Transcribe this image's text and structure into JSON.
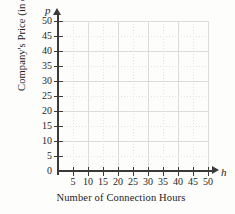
{
  "chart_data": {
    "type": "scatter",
    "title": "",
    "subtitle": "",
    "xlabel": "Number of Connection Hours",
    "ylabel": "Company's Price (in dollars)",
    "x_var": "h",
    "y_var": "p",
    "xlim": [
      0,
      50
    ],
    "ylim": [
      0,
      50
    ],
    "x_ticks": [
      5,
      10,
      15,
      20,
      25,
      30,
      35,
      40,
      45,
      50
    ],
    "y_ticks": [
      0,
      5,
      10,
      15,
      20,
      25,
      30,
      35,
      40,
      45,
      50
    ],
    "x_tick_labels": [
      "5",
      "10",
      "15",
      "20",
      "25",
      "30",
      "35",
      "40",
      "45",
      "50"
    ],
    "y_tick_labels": [
      "0",
      "5",
      "10",
      "15",
      "20",
      "25",
      "30",
      "35",
      "40",
      "45",
      "50"
    ],
    "x_major_gridlines": [
      10,
      20,
      30,
      40,
      50
    ],
    "x_minor_gridlines": [
      5,
      15,
      25,
      35,
      45
    ],
    "y_major_gridlines": [
      10,
      20,
      30,
      40,
      50
    ],
    "y_minor_gridlines": [
      5,
      15,
      25,
      35,
      45
    ],
    "grid": true,
    "legend": null,
    "series": [],
    "values": [],
    "annotations": [],
    "note": "Empty coordinate grid template with no plotted data points",
    "colors": {
      "background": "#fdfdfc",
      "axis": "#3a3a3a",
      "major_grid": "#dcdcdc",
      "minor_grid": "#e2e2e2",
      "text": "#1f1f1f"
    }
  },
  "axes": {
    "y_title": "Company's Price (in dollars)",
    "x_title": "Number of Connection Hours",
    "y_variable": "p",
    "x_variable": "h"
  }
}
